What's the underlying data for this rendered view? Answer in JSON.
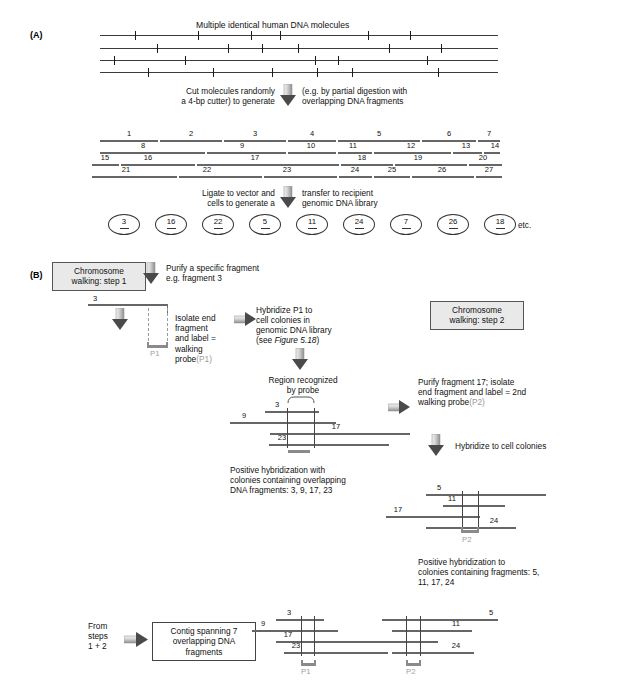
{
  "figure": {
    "panel_a_label": "(A)",
    "panel_b_label": "(B)"
  },
  "panel_a": {
    "title": "Multiple identical human DNA molecules",
    "step1_text_left": "Cut molecules randomly\na 4-bp cutter) to generate",
    "step1_text_right": "(e.g. by partial digestion with\noverlapping DNA fragments",
    "step2_text_left": "Ligate to vector and\ncells to generate a",
    "step2_text_right": "transfer to recipient\ngenomic DNA library",
    "fragment_rows": [
      {
        "labels": [
          "1",
          "2",
          "3",
          "4",
          "5",
          "6",
          "7"
        ]
      },
      {
        "labels": [
          "8",
          "9",
          "10",
          "11",
          "12",
          "13",
          "14"
        ]
      },
      {
        "labels": [
          "15",
          "16",
          "17",
          "18",
          "19",
          "20"
        ]
      },
      {
        "labels": [
          "21",
          "22",
          "23",
          "24",
          "25",
          "26",
          "27"
        ]
      }
    ],
    "colonies": [
      "3",
      "16",
      "22",
      "5",
      "11",
      "24",
      "7",
      "26",
      "18"
    ],
    "colonies_etc": "etc."
  },
  "panel_b": {
    "step1_box": "Chromosome\nwalking: step 1",
    "step1_side_text": "Purify a specific fragment\ne.g. fragment 3",
    "fragment3_label": "3",
    "isolate_text": "Isolate end\nfragment\nand label =\nwalking",
    "isolate_text_last": "probe",
    "isolate_text_last_gray": "(P1)",
    "probe1_label": "P1",
    "hybridize_text": "Hybridize P1 to\ncell colonies in\ngenomic DNA library",
    "hybridize_ref_prefix": "(see ",
    "hybridize_ref_italic": "Figure 5.18",
    "hybridize_ref_suffix": ")",
    "region_text": "Region recognized\nby probe",
    "step1_fragments": [
      "3",
      "9",
      "17",
      "23"
    ],
    "positive_text_1": "Positive hybridization with\ncolonies containing overlapping\nDNA fragments: 3, 9, 17, 23",
    "step2_box": "Chromosome\nwalking: step 2",
    "step2_side_text": "Purify fragment 17; isolate\nend fragment and label = 2nd\nwalking probe",
    "step2_side_gray": "(P2)",
    "hybridize_colonies_text": "Hybridize to cell colonies",
    "step2_fragments": [
      "5",
      "11",
      "17",
      "24"
    ],
    "probe2_label": "P2",
    "positive_text_2": "Positive hybridization to\ncolonies containing fragments: 5,\n11, 17, 24",
    "from_steps_text": "From\nsteps\n1 + 2",
    "contig_box": "Contig spanning 7\noverlapping DNA\nfragments",
    "contig_fragments_left": [
      "3",
      "9",
      "17",
      "23"
    ],
    "contig_fragments_right": [
      "5",
      "11",
      "24"
    ],
    "contig_probe1": "P1",
    "contig_probe2": "P2"
  },
  "colors": {
    "box_fill": "#e9e9e9",
    "line_gray": "#6e6e6e",
    "probe_gray": "#8a8a8a",
    "gray_text": "#9a9a9a"
  }
}
